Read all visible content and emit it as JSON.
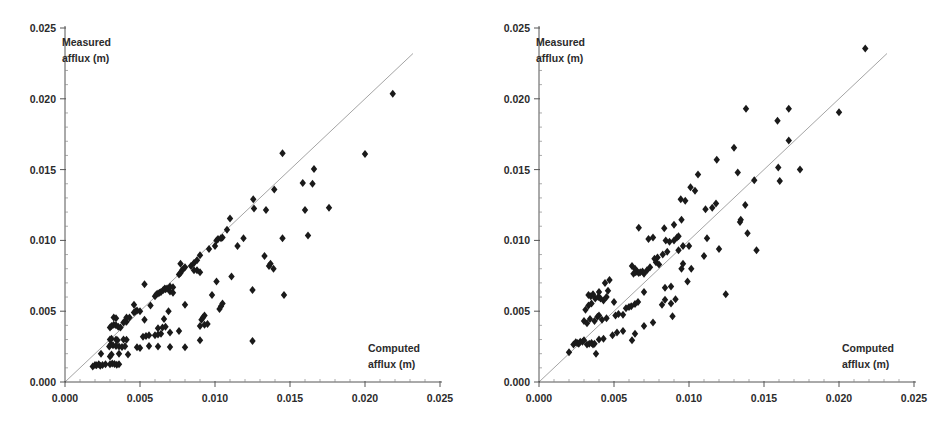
{
  "figure": {
    "title": "",
    "panel_count": 2
  },
  "chart_data": [
    {
      "type": "scatter",
      "panel": "left",
      "title": "",
      "xlabel": "Computed afflux (m)",
      "ylabel": "Measured afflux (m)",
      "xlim": [
        0.0,
        0.025
      ],
      "ylim": [
        0.0,
        0.025
      ],
      "xticks": [
        0.0,
        0.005,
        0.01,
        0.015,
        0.02,
        0.025
      ],
      "yticks": [
        0.0,
        0.005,
        0.01,
        0.015,
        0.02,
        0.025
      ],
      "xtick_labels": [
        "0.000",
        "0.005",
        "0.010",
        "0.015",
        "0.020",
        "0.025"
      ],
      "ytick_labels": [
        "0.000",
        "0.005",
        "0.010",
        "0.015",
        "0.020",
        "0.025"
      ],
      "grid": false,
      "legend": null,
      "reference_line": {
        "name": "1:1 line",
        "slope": 1.0,
        "intercept": 0.0,
        "x_range": [
          0.0,
          0.0232
        ]
      },
      "marker": {
        "shape": "diamond",
        "color": "#1a1a1a",
        "size": 4
      },
      "points": [
        [
          0.00185,
          0.0011
        ],
        [
          0.002,
          0.0012
        ],
        [
          0.0021,
          0.00118
        ],
        [
          0.00225,
          0.00125
        ],
        [
          0.00235,
          0.00115
        ],
        [
          0.0025,
          0.0012
        ],
        [
          0.0027,
          0.00125
        ],
        [
          0.003,
          0.00125
        ],
        [
          0.00315,
          0.0013
        ],
        [
          0.0033,
          0.00128
        ],
        [
          0.00345,
          0.00122
        ],
        [
          0.0036,
          0.00126
        ],
        [
          0.0024,
          0.002
        ],
        [
          0.003,
          0.0018
        ],
        [
          0.0031,
          0.00195
        ],
        [
          0.0036,
          0.002
        ],
        [
          0.0042,
          0.00195
        ],
        [
          0.00295,
          0.0025
        ],
        [
          0.00305,
          0.00265
        ],
        [
          0.0032,
          0.0026
        ],
        [
          0.0034,
          0.00255
        ],
        [
          0.0036,
          0.0025
        ],
        [
          0.0038,
          0.00248
        ],
        [
          0.004,
          0.00252
        ],
        [
          0.0048,
          0.00245
        ],
        [
          0.005,
          0.0024
        ],
        [
          0.0056,
          0.00255
        ],
        [
          0.0062,
          0.0025
        ],
        [
          0.007,
          0.00248
        ],
        [
          0.008,
          0.00245
        ],
        [
          0.009,
          0.00295
        ],
        [
          0.0125,
          0.0029
        ],
        [
          0.003,
          0.003
        ],
        [
          0.0031,
          0.00305
        ],
        [
          0.0034,
          0.003
        ],
        [
          0.0035,
          0.00295
        ],
        [
          0.0039,
          0.003
        ],
        [
          0.0041,
          0.00298
        ],
        [
          0.0052,
          0.0032
        ],
        [
          0.0054,
          0.00325
        ],
        [
          0.0056,
          0.0033
        ],
        [
          0.006,
          0.0033
        ],
        [
          0.0062,
          0.00335
        ],
        [
          0.0064,
          0.0034
        ],
        [
          0.007,
          0.0035
        ],
        [
          0.003,
          0.00385
        ],
        [
          0.0031,
          0.00395
        ],
        [
          0.00325,
          0.00405
        ],
        [
          0.0034,
          0.004
        ],
        [
          0.00355,
          0.0039
        ],
        [
          0.0037,
          0.00385
        ],
        [
          0.0039,
          0.0042
        ],
        [
          0.004,
          0.0043
        ],
        [
          0.0041,
          0.00425
        ],
        [
          0.0062,
          0.0038
        ],
        [
          0.0065,
          0.00385
        ],
        [
          0.0067,
          0.0039
        ],
        [
          0.0076,
          0.0036
        ],
        [
          0.009,
          0.00395
        ],
        [
          0.0093,
          0.00405
        ],
        [
          0.0095,
          0.0041
        ],
        [
          0.00325,
          0.00455
        ],
        [
          0.0034,
          0.0045
        ],
        [
          0.0041,
          0.00455
        ],
        [
          0.0043,
          0.00455
        ],
        [
          0.0046,
          0.0049
        ],
        [
          0.0047,
          0.005
        ],
        [
          0.005,
          0.005
        ],
        [
          0.0053,
          0.0044
        ],
        [
          0.0066,
          0.00445
        ],
        [
          0.0069,
          0.005
        ],
        [
          0.0091,
          0.0044
        ],
        [
          0.0092,
          0.00455
        ],
        [
          0.0093,
          0.0047
        ],
        [
          0.0046,
          0.00545
        ],
        [
          0.0048,
          0.00505
        ],
        [
          0.0057,
          0.0054
        ],
        [
          0.008,
          0.00545
        ],
        [
          0.0103,
          0.00515
        ],
        [
          0.0104,
          0.00535
        ],
        [
          0.0105,
          0.00555
        ],
        [
          0.006,
          0.00605
        ],
        [
          0.0061,
          0.0062
        ],
        [
          0.0062,
          0.00625
        ],
        [
          0.0063,
          0.0063
        ],
        [
          0.0064,
          0.00635
        ],
        [
          0.00655,
          0.0065
        ],
        [
          0.00665,
          0.0066
        ],
        [
          0.0067,
          0.00655
        ],
        [
          0.0068,
          0.0066
        ],
        [
          0.007,
          0.0064
        ],
        [
          0.0072,
          0.0063
        ],
        [
          0.0053,
          0.0069
        ],
        [
          0.007,
          0.00675
        ],
        [
          0.0072,
          0.0067
        ],
        [
          0.0098,
          0.00615
        ],
        [
          0.0125,
          0.0065
        ],
        [
          0.0146,
          0.00615
        ],
        [
          0.0076,
          0.0076
        ],
        [
          0.0077,
          0.0077
        ],
        [
          0.0078,
          0.0079
        ],
        [
          0.0079,
          0.008
        ],
        [
          0.008,
          0.0081
        ],
        [
          0.0077,
          0.00835
        ],
        [
          0.0086,
          0.0079
        ],
        [
          0.0088,
          0.0079
        ],
        [
          0.009,
          0.00775
        ],
        [
          0.0101,
          0.0071
        ],
        [
          0.0111,
          0.00745
        ],
        [
          0.0139,
          0.008
        ],
        [
          0.0136,
          0.0082
        ],
        [
          0.0137,
          0.00835
        ],
        [
          0.0084,
          0.0082
        ],
        [
          0.0086,
          0.0084
        ],
        [
          0.0088,
          0.0086
        ],
        [
          0.009,
          0.00895
        ],
        [
          0.0133,
          0.0089
        ],
        [
          0.0096,
          0.0094
        ],
        [
          0.01,
          0.0096
        ],
        [
          0.0101,
          0.01
        ],
        [
          0.0102,
          0.0101
        ],
        [
          0.0104,
          0.01015
        ],
        [
          0.0105,
          0.0102
        ],
        [
          0.0115,
          0.0096
        ],
        [
          0.0119,
          0.01015
        ],
        [
          0.0145,
          0.01015
        ],
        [
          0.0162,
          0.01035
        ],
        [
          0.0108,
          0.01075
        ],
        [
          0.011,
          0.01155
        ],
        [
          0.01255,
          0.0129
        ],
        [
          0.0126,
          0.01225
        ],
        [
          0.0134,
          0.01215
        ],
        [
          0.016,
          0.01215
        ],
        [
          0.0176,
          0.0123
        ],
        [
          0.01395,
          0.0136
        ],
        [
          0.01585,
          0.01405
        ],
        [
          0.0165,
          0.014
        ],
        [
          0.0166,
          0.01505
        ],
        [
          0.0145,
          0.01615
        ],
        [
          0.02,
          0.0161
        ],
        [
          0.02185,
          0.02035
        ]
      ]
    },
    {
      "type": "scatter",
      "panel": "right",
      "title": "",
      "xlabel": "Computed afflux (m)",
      "ylabel": "Measured afflux (m)",
      "xlim": [
        0.0,
        0.025
      ],
      "ylim": [
        0.0,
        0.025
      ],
      "xticks": [
        0.0,
        0.005,
        0.01,
        0.015,
        0.02,
        0.025
      ],
      "yticks": [
        0.0,
        0.005,
        0.01,
        0.015,
        0.02,
        0.025
      ],
      "xtick_labels": [
        "0.000",
        "0.005",
        "0.010",
        "0.015",
        "0.020",
        "0.025"
      ],
      "ytick_labels": [
        "0.000",
        "0.005",
        "0.010",
        "0.015",
        "0.020",
        "0.025"
      ],
      "grid": false,
      "legend": null,
      "reference_line": {
        "name": "1:1 line",
        "slope": 1.0,
        "intercept": 0.0,
        "x_range": [
          0.0,
          0.0232
        ]
      },
      "marker": {
        "shape": "diamond",
        "color": "#1a1a1a",
        "size": 4
      },
      "points": [
        [
          0.002,
          0.0021
        ],
        [
          0.0023,
          0.00265
        ],
        [
          0.00245,
          0.0028
        ],
        [
          0.00255,
          0.00275
        ],
        [
          0.00265,
          0.0027
        ],
        [
          0.00275,
          0.00285
        ],
        [
          0.0029,
          0.00285
        ],
        [
          0.003,
          0.00295
        ],
        [
          0.0032,
          0.00265
        ],
        [
          0.00335,
          0.0027
        ],
        [
          0.0035,
          0.00275
        ],
        [
          0.0036,
          0.00265
        ],
        [
          0.0037,
          0.0027
        ],
        [
          0.0038,
          0.002
        ],
        [
          0.004,
          0.003
        ],
        [
          0.0043,
          0.00305
        ],
        [
          0.0049,
          0.0033
        ],
        [
          0.0052,
          0.0035
        ],
        [
          0.0056,
          0.0036
        ],
        [
          0.0062,
          0.00295
        ],
        [
          0.0064,
          0.0034
        ],
        [
          0.007,
          0.00395
        ],
        [
          0.0076,
          0.0042
        ],
        [
          0.003,
          0.0043
        ],
        [
          0.0032,
          0.00415
        ],
        [
          0.0034,
          0.00445
        ],
        [
          0.0037,
          0.0043
        ],
        [
          0.0039,
          0.0046
        ],
        [
          0.004,
          0.0047
        ],
        [
          0.0042,
          0.0044
        ],
        [
          0.0045,
          0.0045
        ],
        [
          0.0051,
          0.0047
        ],
        [
          0.0053,
          0.0048
        ],
        [
          0.0056,
          0.00475
        ],
        [
          0.0058,
          0.0052
        ],
        [
          0.006,
          0.0053
        ],
        [
          0.00615,
          0.00535
        ],
        [
          0.0064,
          0.0055
        ],
        [
          0.0089,
          0.00465
        ],
        [
          0.0031,
          0.0051
        ],
        [
          0.0033,
          0.0054
        ],
        [
          0.0035,
          0.00555
        ],
        [
          0.00375,
          0.0059
        ],
        [
          0.00395,
          0.006
        ],
        [
          0.0041,
          0.0059
        ],
        [
          0.0043,
          0.00575
        ],
        [
          0.0045,
          0.006
        ],
        [
          0.005,
          0.00565
        ],
        [
          0.0066,
          0.00565
        ],
        [
          0.0082,
          0.00545
        ],
        [
          0.0084,
          0.0058
        ],
        [
          0.0088,
          0.00555
        ],
        [
          0.0091,
          0.00585
        ],
        [
          0.0033,
          0.00615
        ],
        [
          0.00345,
          0.00605
        ],
        [
          0.0036,
          0.0062
        ],
        [
          0.004,
          0.00635
        ],
        [
          0.0046,
          0.00645
        ],
        [
          0.007,
          0.00635
        ],
        [
          0.0084,
          0.00665
        ],
        [
          0.0088,
          0.00675
        ],
        [
          0.01245,
          0.0062
        ],
        [
          0.0044,
          0.007
        ],
        [
          0.0047,
          0.0072
        ],
        [
          0.0063,
          0.00765
        ],
        [
          0.00645,
          0.00775
        ],
        [
          0.00655,
          0.0078
        ],
        [
          0.00665,
          0.0077
        ],
        [
          0.00675,
          0.00775
        ],
        [
          0.0069,
          0.0078
        ],
        [
          0.007,
          0.00765
        ],
        [
          0.0072,
          0.0079
        ],
        [
          0.0074,
          0.0081
        ],
        [
          0.0062,
          0.0082
        ],
        [
          0.0064,
          0.008
        ],
        [
          0.0078,
          0.00845
        ],
        [
          0.008,
          0.0083
        ],
        [
          0.0095,
          0.008
        ],
        [
          0.01015,
          0.008
        ],
        [
          0.0099,
          0.0071
        ],
        [
          0.0077,
          0.0087
        ],
        [
          0.0079,
          0.0088
        ],
        [
          0.0096,
          0.00835
        ],
        [
          0.00825,
          0.009
        ],
        [
          0.00855,
          0.0092
        ],
        [
          0.0093,
          0.0093
        ],
        [
          0.0096,
          0.0096
        ],
        [
          0.01,
          0.0096
        ],
        [
          0.011,
          0.0089
        ],
        [
          0.012,
          0.0094
        ],
        [
          0.0145,
          0.0093
        ],
        [
          0.0073,
          0.0101
        ],
        [
          0.0076,
          0.0102
        ],
        [
          0.00845,
          0.01
        ],
        [
          0.0087,
          0.0099
        ],
        [
          0.009,
          0.01
        ],
        [
          0.0092,
          0.0102
        ],
        [
          0.0093,
          0.0103
        ],
        [
          0.0112,
          0.01015
        ],
        [
          0.0139,
          0.0105
        ],
        [
          0.00665,
          0.0109
        ],
        [
          0.00835,
          0.01085
        ],
        [
          0.009,
          0.0111
        ],
        [
          0.0095,
          0.01145
        ],
        [
          0.0134,
          0.0113
        ],
        [
          0.01345,
          0.01145
        ],
        [
          0.0111,
          0.0122
        ],
        [
          0.01155,
          0.0123
        ],
        [
          0.0118,
          0.0126
        ],
        [
          0.01375,
          0.0125
        ],
        [
          0.00945,
          0.0129
        ],
        [
          0.00975,
          0.0128
        ],
        [
          0.0104,
          0.0135
        ],
        [
          0.0101,
          0.01375
        ],
        [
          0.0106,
          0.01465
        ],
        [
          0.01325,
          0.0148
        ],
        [
          0.01435,
          0.01425
        ],
        [
          0.01605,
          0.0142
        ],
        [
          0.01595,
          0.01515
        ],
        [
          0.0174,
          0.015
        ],
        [
          0.01185,
          0.0157
        ],
        [
          0.013,
          0.01655
        ],
        [
          0.01665,
          0.01705
        ],
        [
          0.0159,
          0.01845
        ],
        [
          0.0138,
          0.0193
        ],
        [
          0.01665,
          0.0193
        ],
        [
          0.02,
          0.01905
        ],
        [
          0.02175,
          0.02355
        ]
      ]
    }
  ],
  "axes": {
    "ylabel_line1": "Measured",
    "ylabel_line2": "afflux (m)",
    "xlabel_line1": "Computed",
    "xlabel_line2": "afflux (m)"
  },
  "colors": {
    "marker": "#1a1a1a",
    "axis": "#555555",
    "reference_line": "#9a9a9a",
    "text": "#2b2b2b",
    "background": "#ffffff"
  }
}
